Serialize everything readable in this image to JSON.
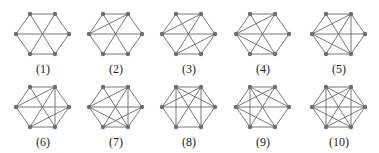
{
  "figure": {
    "vertex_color": "#6e6e6e",
    "edge_color": "#6a6a6a",
    "vertex_order": [
      "top-left",
      "top-right",
      "right",
      "bottom-right",
      "bottom-left",
      "left"
    ],
    "base_edges": [
      [
        0,
        1
      ],
      [
        1,
        2
      ],
      [
        2,
        3
      ],
      [
        3,
        4
      ],
      [
        4,
        5
      ],
      [
        5,
        0
      ],
      [
        0,
        3
      ],
      [
        1,
        4
      ],
      [
        2,
        5
      ]
    ],
    "graphs": [
      {
        "label": "(1)",
        "x": 10,
        "y": 7,
        "extra_edges": []
      },
      {
        "label": "(2)",
        "x": 83,
        "y": 7,
        "extra_edges": [
          [
            5,
            1
          ]
        ]
      },
      {
        "label": "(3)",
        "x": 156,
        "y": 7,
        "extra_edges": [
          [
            5,
            1
          ],
          [
            4,
            2
          ]
        ]
      },
      {
        "label": "(4)",
        "x": 230,
        "y": 7,
        "extra_edges": [
          [
            5,
            1
          ],
          [
            5,
            3
          ]
        ]
      },
      {
        "label": "(5)",
        "x": 306,
        "y": 7,
        "extra_edges": [
          [
            5,
            1
          ],
          [
            5,
            3
          ],
          [
            1,
            3
          ]
        ]
      },
      {
        "label": "(6)",
        "x": 10,
        "y": 80,
        "extra_edges": [
          [
            5,
            1
          ],
          [
            1,
            3
          ],
          [
            4,
            2
          ]
        ]
      },
      {
        "label": "(7)",
        "x": 83,
        "y": 80,
        "extra_edges": [
          [
            5,
            1
          ],
          [
            5,
            3
          ],
          [
            1,
            3
          ],
          [
            4,
            2
          ]
        ]
      },
      {
        "label": "(8)",
        "x": 156,
        "y": 80,
        "extra_edges": [
          [
            5,
            1
          ],
          [
            1,
            3
          ],
          [
            0,
            2
          ],
          [
            0,
            4
          ]
        ]
      },
      {
        "label": "(9)",
        "x": 230,
        "y": 80,
        "extra_edges": [
          [
            5,
            1
          ],
          [
            5,
            3
          ],
          [
            0,
            2
          ],
          [
            0,
            4
          ]
        ]
      },
      {
        "label": "(10)",
        "x": 306,
        "y": 80,
        "extra_edges": [
          [
            5,
            1
          ],
          [
            5,
            3
          ],
          [
            1,
            3
          ],
          [
            0,
            2
          ],
          [
            0,
            4
          ],
          [
            4,
            2
          ]
        ]
      }
    ]
  }
}
